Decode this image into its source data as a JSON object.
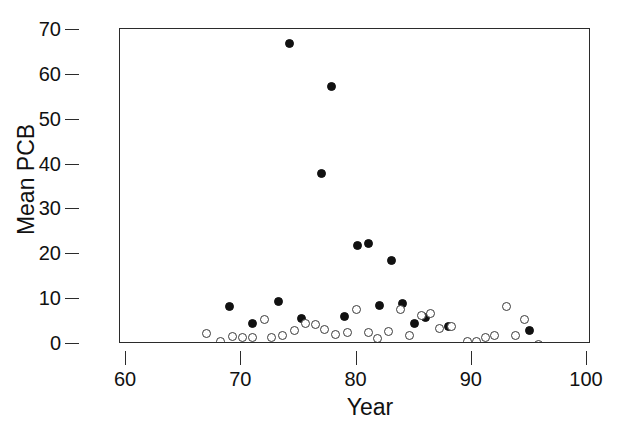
{
  "figure": {
    "title": "",
    "background_color": "#ffffff",
    "axis_color": "#2b2b2b"
  },
  "axes": {
    "x": {
      "label": "Year",
      "ticks": [
        60,
        70,
        80,
        90,
        100
      ],
      "tick_labels": [
        "60",
        "70",
        "80",
        "90",
        "100"
      ],
      "range": [
        60,
        100
      ]
    },
    "y": {
      "label": "Mean PCB",
      "ticks": [
        0,
        10,
        20,
        30,
        40,
        50,
        60,
        70
      ],
      "tick_labels": [
        "0",
        "10",
        "20",
        "30",
        "40",
        "50",
        "60",
        "70"
      ],
      "range": [
        0,
        70
      ]
    }
  },
  "chart_data": {
    "type": "scatter",
    "title": "",
    "xlabel": "Year",
    "ylabel": "Mean PCB",
    "xlim": [
      60,
      100
    ],
    "ylim": [
      0,
      70
    ],
    "grid": false,
    "legend": "none",
    "marker_colors": {
      "filled": "#111111",
      "open_edge": "#3a3a3a",
      "open_fill": "#ffffff"
    },
    "series": [
      {
        "name": "filled-circles",
        "marker": "filled-circle",
        "points": [
          {
            "x": 69.0,
            "y": 8.3
          },
          {
            "x": 71.0,
            "y": 4.6
          },
          {
            "x": 73.2,
            "y": 9.5
          },
          {
            "x": 74.2,
            "y": 67.0
          },
          {
            "x": 75.2,
            "y": 5.7
          },
          {
            "x": 77.0,
            "y": 38.0
          },
          {
            "x": 77.8,
            "y": 57.5
          },
          {
            "x": 79.0,
            "y": 6.2
          },
          {
            "x": 80.1,
            "y": 22.0
          },
          {
            "x": 81.0,
            "y": 22.5
          },
          {
            "x": 82.0,
            "y": 8.5
          },
          {
            "x": 83.0,
            "y": 18.7
          },
          {
            "x": 84.0,
            "y": 9.1
          },
          {
            "x": 85.0,
            "y": 4.6
          },
          {
            "x": 86.0,
            "y": 5.9
          },
          {
            "x": 88.0,
            "y": 4.0
          },
          {
            "x": 95.0,
            "y": 3.0
          }
        ]
      },
      {
        "name": "open-circles",
        "marker": "open-circle",
        "points": [
          {
            "x": 67.0,
            "y": 2.3
          },
          {
            "x": 68.2,
            "y": 0.6
          },
          {
            "x": 69.2,
            "y": 1.6
          },
          {
            "x": 70.1,
            "y": 1.5
          },
          {
            "x": 71.0,
            "y": 1.5
          },
          {
            "x": 72.0,
            "y": 5.4
          },
          {
            "x": 72.6,
            "y": 1.5
          },
          {
            "x": 73.6,
            "y": 1.8
          },
          {
            "x": 74.6,
            "y": 3.0
          },
          {
            "x": 75.6,
            "y": 4.5
          },
          {
            "x": 76.4,
            "y": 4.4
          },
          {
            "x": 77.2,
            "y": 3.2
          },
          {
            "x": 78.2,
            "y": 2.1
          },
          {
            "x": 79.2,
            "y": 2.6
          },
          {
            "x": 80.0,
            "y": 7.7
          },
          {
            "x": 81.0,
            "y": 2.6
          },
          {
            "x": 81.8,
            "y": 1.3
          },
          {
            "x": 82.8,
            "y": 2.8
          },
          {
            "x": 83.8,
            "y": 7.6
          },
          {
            "x": 84.6,
            "y": 1.8
          },
          {
            "x": 85.6,
            "y": 6.4
          },
          {
            "x": 86.4,
            "y": 6.8
          },
          {
            "x": 87.2,
            "y": 3.5
          },
          {
            "x": 88.2,
            "y": 3.8
          },
          {
            "x": 89.6,
            "y": 0.5
          },
          {
            "x": 90.4,
            "y": 0.6
          },
          {
            "x": 91.2,
            "y": 1.4
          },
          {
            "x": 92.0,
            "y": 1.8
          },
          {
            "x": 93.0,
            "y": 8.3
          },
          {
            "x": 93.8,
            "y": 2.0
          },
          {
            "x": 94.6,
            "y": 5.4
          },
          {
            "x": 95.8,
            "y": -0.1
          }
        ]
      }
    ]
  }
}
